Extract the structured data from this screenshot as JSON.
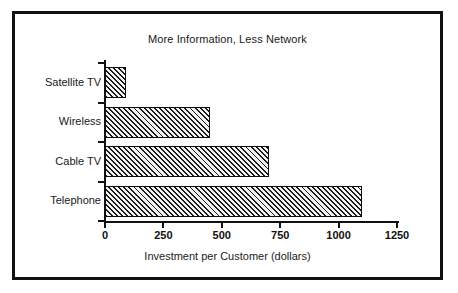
{
  "chart_data": {
    "type": "bar",
    "orientation": "horizontal",
    "title": "More Information, Less Network",
    "xlabel": "Investment per Customer (dollars)",
    "ylabel": "",
    "categories": [
      "Satellite TV",
      "Wireless",
      "Cable TV",
      "Telephone"
    ],
    "values": [
      90,
      450,
      700,
      1100
    ],
    "xlim": [
      0,
      1250
    ],
    "xticks": [
      0,
      250,
      500,
      750,
      1000,
      1250
    ],
    "xtick_labels": [
      "0",
      "250",
      "500",
      "750",
      "1000",
      "1250"
    ],
    "grid": false,
    "legend": null,
    "bar_style": {
      "fill": "diagonal-hatch",
      "hatch_color": "#1b1b1b",
      "background_color": "#f2f2f2",
      "edge_color": "#0d0d0d"
    },
    "frame_color": "#111111",
    "axis_color": "#111111",
    "text_color": "#1a1a1a",
    "note": "Bars ordered top to bottom: Satellite TV shortest, Telephone longest."
  }
}
